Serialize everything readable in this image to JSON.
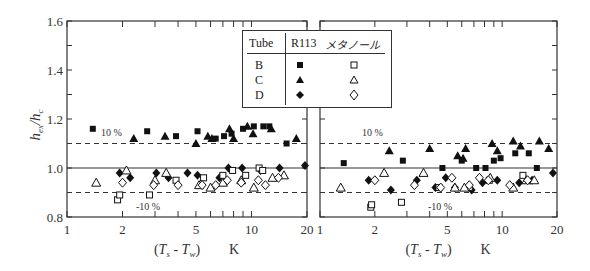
{
  "chart_data": [
    {
      "type": "scatter",
      "panel": "left",
      "title": "",
      "xlabel": "(Ts - Tw)  K",
      "ylabel": "hex/hc",
      "xscale": "log",
      "xlim": [
        1,
        20
      ],
      "ylim": [
        0.8,
        1.6
      ],
      "xticks": [
        1,
        2,
        5,
        10,
        20
      ],
      "yticks": [
        0.8,
        1.0,
        1.2,
        1.4,
        1.6
      ],
      "reference_lines": [
        {
          "y": 1.0,
          "style": "solid"
        },
        {
          "y": 1.1,
          "style": "dashed",
          "label": "10 %"
        },
        {
          "y": 0.9,
          "style": "dashed",
          "label": "-10 %"
        }
      ],
      "series": [
        {
          "name": "B R113",
          "marker": "square-filled",
          "points": [
            [
              1.38,
              1.16
            ],
            [
              2.72,
              1.15
            ],
            [
              3.9,
              1.13
            ],
            [
              5.1,
              1.15
            ],
            [
              6.4,
              1.12
            ],
            [
              7.1,
              1.13
            ],
            [
              7.8,
              1.14
            ],
            [
              9.0,
              1.16
            ],
            [
              10.3,
              1.17
            ],
            [
              11.6,
              1.17
            ],
            [
              12.5,
              1.17
            ],
            [
              15.5,
              1.1
            ]
          ]
        },
        {
          "name": "C R113",
          "marker": "triangle-filled",
          "points": [
            [
              2.3,
              1.12
            ],
            [
              3.4,
              1.13
            ],
            [
              5.0,
              1.1
            ],
            [
              5.8,
              1.13
            ],
            [
              6.1,
              1.12
            ],
            [
              7.6,
              1.16
            ],
            [
              8.0,
              1.12
            ],
            [
              9.5,
              1.17
            ],
            [
              10.2,
              1.14
            ],
            [
              12.8,
              1.16
            ],
            [
              17.5,
              1.12
            ]
          ]
        },
        {
          "name": "D R113",
          "marker": "diamond-filled",
          "points": [
            [
              1.93,
              0.98
            ],
            [
              2.2,
              0.96
            ],
            [
              3.05,
              0.98
            ],
            [
              3.55,
              0.96
            ],
            [
              4.5,
              0.98
            ],
            [
              5.1,
              0.97
            ],
            [
              6.7,
              0.96
            ],
            [
              7.5,
              1.0
            ],
            [
              8.9,
              1.0
            ],
            [
              11.2,
              0.99
            ],
            [
              14.2,
              1.0
            ],
            [
              19.5,
              1.01
            ]
          ]
        },
        {
          "name": "B メタノール",
          "marker": "square-open",
          "points": [
            [
              1.88,
              0.87
            ],
            [
              1.93,
              0.89
            ],
            [
              2.8,
              0.89
            ],
            [
              3.9,
              0.95
            ],
            [
              5.5,
              0.96
            ],
            [
              7.0,
              0.97
            ],
            [
              7.9,
              0.99
            ],
            [
              9.3,
              0.97
            ],
            [
              11.0,
              1.0
            ],
            [
              11.5,
              0.99
            ]
          ]
        },
        {
          "name": "C メタノール",
          "marker": "triangle-open",
          "points": [
            [
              1.44,
              0.94
            ],
            [
              2.1,
              0.99
            ],
            [
              3.0,
              0.95
            ],
            [
              3.45,
              0.98
            ],
            [
              5.2,
              0.93
            ],
            [
              6.0,
              0.92
            ],
            [
              7.0,
              0.94
            ],
            [
              8.8,
              0.95
            ],
            [
              10.3,
              0.92
            ],
            [
              13.0,
              0.96
            ],
            [
              15.0,
              0.97
            ]
          ]
        },
        {
          "name": "D メタノール",
          "marker": "diamond-open",
          "points": [
            [
              2.0,
              0.94
            ],
            [
              2.95,
              0.93
            ],
            [
              4.0,
              0.93
            ],
            [
              5.4,
              0.93
            ],
            [
              6.4,
              0.93
            ],
            [
              7.4,
              0.95
            ],
            [
              8.8,
              0.94
            ],
            [
              10.9,
              0.95
            ],
            [
              11.9,
              0.93
            ],
            [
              14.0,
              0.96
            ]
          ]
        }
      ]
    },
    {
      "type": "scatter",
      "panel": "right",
      "title": "",
      "xlabel": "(Ts - Tw)  K",
      "ylabel": "hex/hc",
      "xscale": "log",
      "xlim": [
        1,
        20
      ],
      "ylim": [
        0.8,
        1.6
      ],
      "xticks": [
        1,
        2,
        5,
        10,
        20
      ],
      "yticks": [
        0.8,
        1.0,
        1.2,
        1.4,
        1.6
      ],
      "reference_lines": [
        {
          "y": 1.0,
          "style": "solid"
        },
        {
          "y": 1.1,
          "style": "dashed",
          "label": "10 %"
        },
        {
          "y": 0.9,
          "style": "dashed",
          "label": "-10 %"
        }
      ],
      "series": [
        {
          "name": "B R113",
          "marker": "square-filled",
          "points": [
            [
              1.35,
              1.02
            ],
            [
              2.85,
              1.03
            ],
            [
              4.7,
              1.0
            ],
            [
              6.0,
              1.03
            ],
            [
              7.2,
              1.0
            ],
            [
              8.1,
              1.0
            ],
            [
              9.0,
              1.03
            ],
            [
              9.8,
              1.04
            ],
            [
              11.8,
              1.06
            ],
            [
              14.0,
              1.06
            ],
            [
              15.5,
              1.0
            ]
          ]
        },
        {
          "name": "C R113",
          "marker": "triangle-filled",
          "points": [
            [
              2.4,
              1.07
            ],
            [
              4.0,
              1.08
            ],
            [
              5.7,
              1.05
            ],
            [
              6.3,
              1.08
            ],
            [
              6.1,
              1.04
            ],
            [
              8.8,
              1.1
            ],
            [
              9.4,
              1.07
            ],
            [
              11.5,
              1.11
            ],
            [
              12.6,
              1.09
            ],
            [
              16.0,
              1.11
            ],
            [
              18.0,
              1.08
            ]
          ]
        },
        {
          "name": "D R113",
          "marker": "diamond-filled",
          "points": [
            [
              1.85,
              0.95
            ],
            [
              2.45,
              0.91
            ],
            [
              3.4,
              0.95
            ],
            [
              4.3,
              0.92
            ],
            [
              4.9,
              0.96
            ],
            [
              5.5,
              0.92
            ],
            [
              6.8,
              0.91
            ],
            [
              7.8,
              0.94
            ],
            [
              9.4,
              0.95
            ],
            [
              12.4,
              0.94
            ],
            [
              14.6,
              0.95
            ],
            [
              19.0,
              0.98
            ]
          ]
        },
        {
          "name": "B メタノール",
          "marker": "square-open",
          "points": [
            [
              1.9,
              0.84
            ],
            [
              1.92,
              0.85
            ],
            [
              2.8,
              0.86
            ],
            [
              4.5,
              0.92
            ],
            [
              6.6,
              0.92
            ],
            [
              8.5,
              0.95
            ],
            [
              13.0,
              0.97
            ]
          ]
        },
        {
          "name": "C メタノール",
          "marker": "triangle-open",
          "points": [
            [
              1.3,
              0.92
            ],
            [
              2.25,
              0.98
            ],
            [
              3.7,
              0.98
            ],
            [
              5.5,
              0.92
            ],
            [
              6.2,
              0.92
            ],
            [
              8.6,
              0.96
            ],
            [
              11.5,
              0.92
            ],
            [
              13.6,
              0.95
            ],
            [
              15.0,
              0.95
            ]
          ]
        },
        {
          "name": "D メタノール",
          "marker": "diamond-open",
          "points": [
            [
              2.0,
              0.95
            ],
            [
              3.3,
              0.93
            ],
            [
              4.6,
              0.92
            ],
            [
              5.3,
              0.96
            ],
            [
              6.6,
              0.93
            ],
            [
              7.5,
              0.96
            ],
            [
              8.4,
              0.95
            ],
            [
              11.0,
              0.93
            ],
            [
              13.8,
              0.95
            ]
          ]
        }
      ]
    }
  ],
  "legend": {
    "header": {
      "tube": "Tube",
      "r113": "R113",
      "methanol": "メタノール"
    },
    "rows": [
      {
        "tube": "B",
        "r113_marker": "square-filled",
        "methanol_marker": "square-open"
      },
      {
        "tube": "C",
        "r113_marker": "triangle-filled",
        "methanol_marker": "triangle-open"
      },
      {
        "tube": "D",
        "r113_marker": "diamond-filled",
        "methanol_marker": "diamond-open"
      }
    ]
  },
  "labels": {
    "ylabel": "hex/hc",
    "xlabel_left": "(Ts - Tw)",
    "xlabel_unit": "K",
    "plus10": "10 %",
    "minus10": "-10 %",
    "xticks": [
      "1",
      "2",
      "5",
      "10",
      "20"
    ],
    "yticks": [
      "1.6",
      "1.4",
      "1.2",
      "1.0",
      "0.8"
    ]
  }
}
